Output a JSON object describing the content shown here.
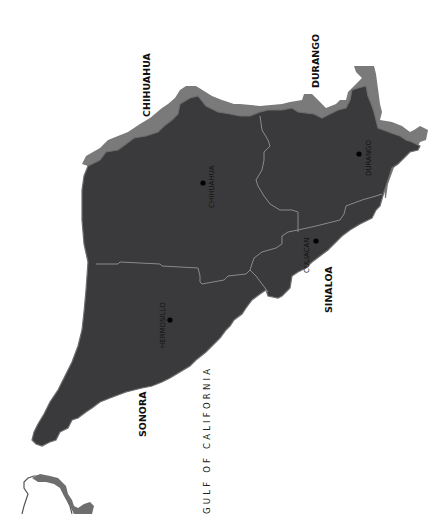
{
  "map": {
    "orientation": "rotated 90deg counter-clockwise",
    "colors": {
      "land": "#3a3a3c",
      "land_shadow": "#7a7a7a",
      "border": "#8a8a8a",
      "background": "#ffffff",
      "city_dot": "#000000"
    },
    "states": [
      {
        "name": "CHIHUAHUA"
      },
      {
        "name": "DURANGO"
      },
      {
        "name": "SONORA"
      },
      {
        "name": "SINALOA"
      }
    ],
    "cities": [
      {
        "name": "CHIHUAHUA"
      },
      {
        "name": "DURANGO"
      },
      {
        "name": "HERMOSILLO"
      },
      {
        "name": "CULIACAN"
      }
    ],
    "water": {
      "name": "GULF OF CALIFORNIA"
    },
    "inset": {
      "label": "Mexico locator inset"
    }
  }
}
